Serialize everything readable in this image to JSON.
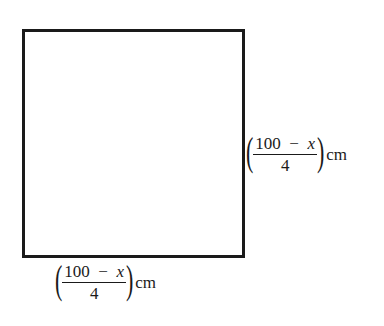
{
  "diagram": {
    "shape": "square",
    "stroke_color": "#1a1a1a",
    "fill_color": "#ffffff",
    "side_labels": {
      "right": {
        "numerator_const": "100",
        "minus": "−",
        "numerator_var": "x",
        "denominator": "4",
        "unit": "cm",
        "open_paren": "(",
        "close_paren": ")"
      },
      "bottom": {
        "numerator_const": "100",
        "minus": "−",
        "numerator_var": "x",
        "denominator": "4",
        "unit": "cm",
        "open_paren": "(",
        "close_paren": ")"
      }
    }
  }
}
